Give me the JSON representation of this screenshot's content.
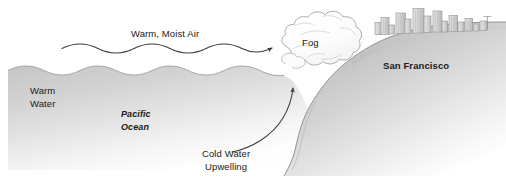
{
  "diagram": {
    "type": "cross-section-illustration",
    "width": 506,
    "height": 184,
    "background_color": "#ffffff"
  },
  "labels": {
    "warm_moist_air": "Warm, Moist Air",
    "fog": "Fog",
    "san_francisco": "San Francisco",
    "warm_water": "Warm\nWater",
    "pacific_ocean": "Pacific\nOcean",
    "cold_water_upwelling": "Cold Water\nUpwelling"
  },
  "elements": {
    "ocean_name": "ocean-water-body",
    "land_name": "san-francisco-landmass",
    "fog_name": "fog-cloud",
    "skyline_name": "city-skyline",
    "wind_arrow_name": "warm-moist-air-arrow",
    "upwelling_arrow_name": "cold-water-upwelling-arrow"
  },
  "colors": {
    "ocean_top": "#c9c9c9",
    "ocean_bottom": "#fdfdfd",
    "land_top": "#bfbfbf",
    "land_bottom": "#f7f7f7",
    "fog_fill": "#fbfbfb",
    "outline": "#8a8a8a",
    "arrow": "#4a4a4a",
    "text": "#1a1a1a",
    "building_fill": "#d8d8d8",
    "building_stroke": "#8f8f8f"
  }
}
